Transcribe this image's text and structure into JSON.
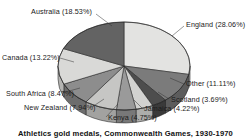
{
  "chart_data": {
    "type": "pie",
    "title": "Athletics gold medals, Commonwealth Games, 1930-1970",
    "xlabel": "",
    "ylabel": "",
    "legend_position": "none",
    "grid": false,
    "three_d": true,
    "categories": [
      "England",
      "Other",
      "Scotland",
      "Jamaica",
      "Kenya",
      "New Zealand",
      "South Africa",
      "Canada",
      "Australia"
    ],
    "values": [
      28.06,
      11.11,
      3.69,
      4.22,
      4.75,
      7.94,
      8.47,
      13.22,
      18.53
    ],
    "unit": "%",
    "slices": [
      {
        "label": "England",
        "value": 28.06,
        "text": "England (28.06%)",
        "color": "#e3e3e1",
        "side_color": "#bdbdbb"
      },
      {
        "label": "Other",
        "value": 11.11,
        "text": "Other  (11.11%)",
        "color": "#7b7b7b",
        "side_color": "#5c5c5c"
      },
      {
        "label": "Scotland",
        "value": 3.69,
        "text": "Scotland (3.69%)",
        "color": "#4d4d4d",
        "side_color": "#3a3a3a"
      },
      {
        "label": "Jamaica",
        "value": 4.22,
        "text": "Jamaica (4.22%)",
        "color": "#d2d2d0",
        "side_color": "#adadab"
      },
      {
        "label": "Kenya",
        "value": 4.75,
        "text": "Kenya (4.75%)",
        "color": "#9a9a9a",
        "side_color": "#787878"
      },
      {
        "label": "New Zealand",
        "value": 7.94,
        "text": "New Zealand (7.94%)",
        "color": "#c6c6c4",
        "side_color": "#a2a2a0"
      },
      {
        "label": "South Africa",
        "value": 8.47,
        "text": "South Africa (8.47%)",
        "color": "#8d8d8d",
        "side_color": "#6d6d6d"
      },
      {
        "label": "Canada",
        "value": 13.22,
        "text": "Canada (13.22%)",
        "color": "#d9d9d7",
        "side_color": "#b4b4b2"
      },
      {
        "label": "Australia",
        "value": 18.53,
        "text": "Australia (18.53%)",
        "color": "#636363",
        "side_color": "#4a4a4a"
      }
    ]
  },
  "labels": {
    "australia": "Australia (18.53%)",
    "england": "England (28.06%)",
    "canada": "Canada (13.22%)",
    "other": "Other  (11.11%)",
    "south_africa": "South Africa (8.47%)",
    "scotland": "Scotland (3.69%)",
    "new_zealand": "New Zealand (7.94%)",
    "jamaica": "Jamaica (4.22%)",
    "kenya": "Kenya (4.75%)"
  }
}
